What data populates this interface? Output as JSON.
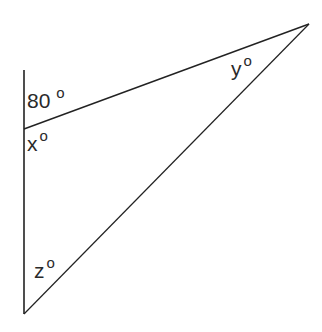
{
  "figure": {
    "type": "triangle-angle-diagram",
    "stroke_color": "#222222",
    "text_color": "#2a2a2a",
    "background": "#ffffff",
    "vertices": {
      "left_top_of_extended_side": {
        "x": 24,
        "y": 70
      },
      "left_vertex": {
        "x": 24,
        "y": 129
      },
      "right_vertex": {
        "x": 309,
        "y": 24
      },
      "bottom_vertex": {
        "x": 24,
        "y": 314
      }
    },
    "labels": [
      {
        "id": "exterior",
        "text": "80",
        "degree": "o",
        "x": 27,
        "y": 90
      },
      {
        "id": "x",
        "text": "x",
        "degree": "o",
        "x": 27,
        "y": 133
      },
      {
        "id": "y",
        "text": "y",
        "degree": "o",
        "x": 231,
        "y": 58
      },
      {
        "id": "z",
        "text": "z",
        "degree": "o",
        "x": 34,
        "y": 260
      }
    ]
  }
}
